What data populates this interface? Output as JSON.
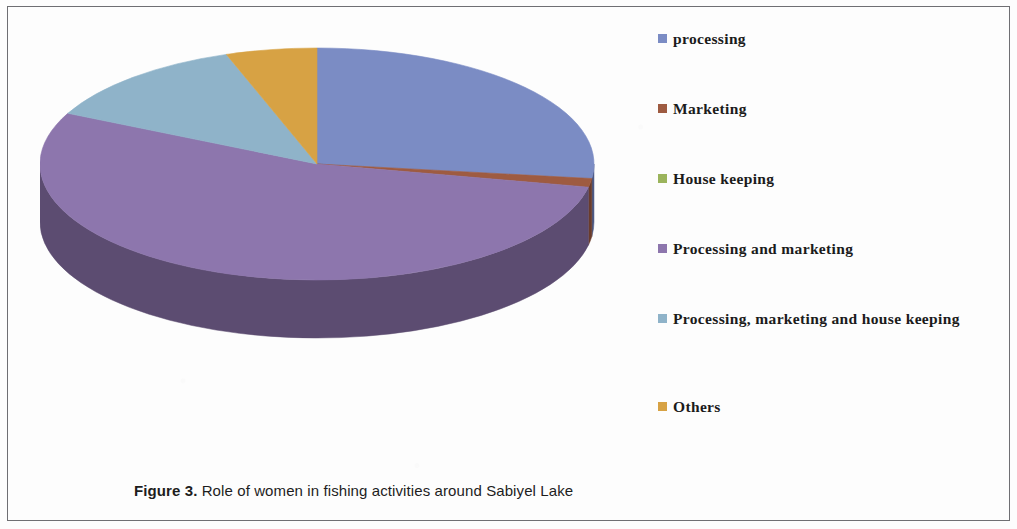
{
  "figure": {
    "caption_prefix": "Figure 3.",
    "caption_text": " Role of women in fishing activities around Sabiyel Lake"
  },
  "chart_data": {
    "type": "pie",
    "title": "Role of women in fishing activities around Sabiyel Lake",
    "style": "3d-pie",
    "legend_position": "right",
    "categories": [
      "processing",
      "Marketing",
      "House keeping",
      "Processing and marketing",
      "Processing, marketing and house keeping",
      "Others"
    ],
    "values": [
      27,
      1.2,
      0,
      54,
      12.5,
      5.3
    ],
    "unit": "percent",
    "colors": [
      "#7b8cc4",
      "#9e5b41",
      "#9bb45c",
      "#8d76ad",
      "#8fb3c9",
      "#d7a244"
    ],
    "side_colors": [
      "#4d5a85",
      "#6a3c2c",
      "#69793d",
      "#5c4c71",
      "#5f7786",
      "#8f6c2c"
    ],
    "start_angle_deg": 0,
    "slice_angles_deg": [
      97.2,
      4.3,
      0,
      194.4,
      45.0,
      19.1
    ]
  },
  "legend": {
    "items": [
      {
        "label": "processing",
        "color": "#7b8cc4"
      },
      {
        "label": "Marketing",
        "color": "#9e5b41"
      },
      {
        "label": "House keeping",
        "color": "#9bb45c"
      },
      {
        "label": "Processing and marketing",
        "color": "#8d76ad"
      },
      {
        "label": "Processing, marketing and house keeping",
        "color": "#8fb3c9"
      },
      {
        "label": "Others",
        "color": "#d7a244"
      }
    ]
  }
}
